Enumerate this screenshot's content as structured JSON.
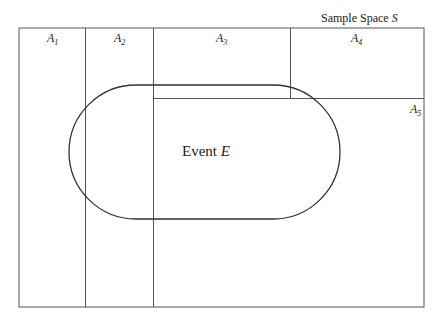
{
  "diagram": {
    "title_prefix": "Sample Space ",
    "title_symbol": "S",
    "event_prefix": "Event ",
    "event_symbol": "E",
    "partitions": [
      {
        "letter": "A",
        "index": "1"
      },
      {
        "letter": "A",
        "index": "2"
      },
      {
        "letter": "A",
        "index": "3"
      },
      {
        "letter": "A",
        "index": "4"
      },
      {
        "letter": "A",
        "index": "5"
      }
    ],
    "colors": {
      "line": "#444444",
      "event_outline": "#333333",
      "background": "#ffffff"
    }
  }
}
